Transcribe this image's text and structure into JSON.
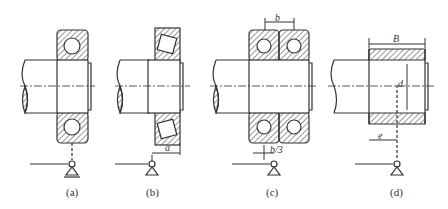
{
  "figure": {
    "panels": [
      {
        "id": "a",
        "label": "(a)",
        "dimension": ""
      },
      {
        "id": "b",
        "label": "(b)",
        "dimension": "a"
      },
      {
        "id": "c",
        "label": "(c)",
        "dimensions": [
          "b",
          "b/3"
        ]
      },
      {
        "id": "d",
        "label": "(d)",
        "dimensions": [
          "B",
          "d",
          "e"
        ]
      }
    ]
  },
  "colors": {
    "line": "#333333",
    "background": "#ffffff"
  }
}
